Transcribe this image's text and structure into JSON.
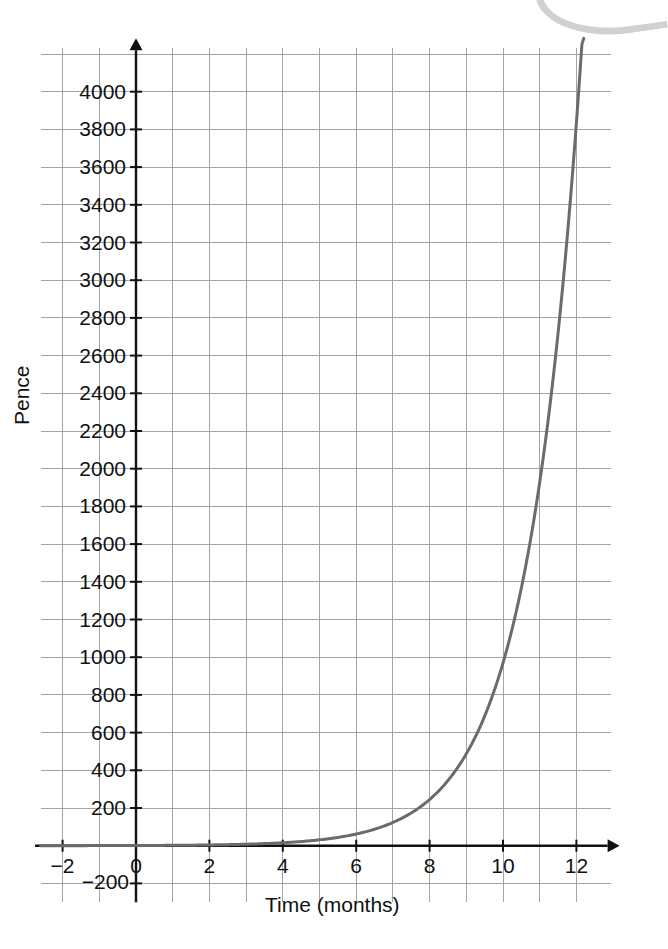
{
  "chart_data": {
    "type": "line",
    "title": "",
    "xlabel": "Time (months)",
    "ylabel": "Pence",
    "xlim": [
      -2.6,
      12.9
    ],
    "ylim": [
      -300,
      4250
    ],
    "grid": true,
    "grid_step_x": 1,
    "grid_step_y": 200,
    "legend": "none",
    "x_ticks": [
      -2,
      0,
      2,
      4,
      6,
      8,
      10,
      12
    ],
    "x_tick_labels": [
      "−2",
      "0",
      "2",
      "4",
      "6",
      "8",
      "10",
      "12"
    ],
    "y_ticks": [
      -200,
      200,
      400,
      600,
      800,
      1000,
      1200,
      1400,
      1600,
      1800,
      2000,
      2200,
      2400,
      2600,
      2800,
      3000,
      3200,
      3400,
      3600,
      3800,
      4000
    ],
    "y_tick_labels": [
      "−200",
      "200",
      "400",
      "600",
      "800",
      "1000",
      "1200",
      "1400",
      "1600",
      "1800",
      "2000",
      "2200",
      "2400",
      "2600",
      "2800",
      "3000",
      "3200",
      "3400",
      "3600",
      "3800",
      "4000"
    ],
    "series": [
      {
        "name": "Amount (pence)",
        "color": "#6b6b6b",
        "x": [
          0,
          1,
          2,
          3,
          4,
          5,
          6,
          7,
          8,
          9,
          10,
          11,
          12,
          12.2
        ],
        "values": [
          1,
          2,
          4,
          8,
          15,
          30,
          60,
          120,
          240,
          480,
          960,
          1920,
          3840,
          4400
        ]
      }
    ],
    "annotations": [],
    "axis_arrow_x": true,
    "axis_arrow_y": true
  },
  "colors": {
    "curve": "#6b6b6b",
    "axis": "#111111",
    "grid_major": "#9a9a9a",
    "grid_minor": "#d8d8d8",
    "text": "#111111"
  }
}
